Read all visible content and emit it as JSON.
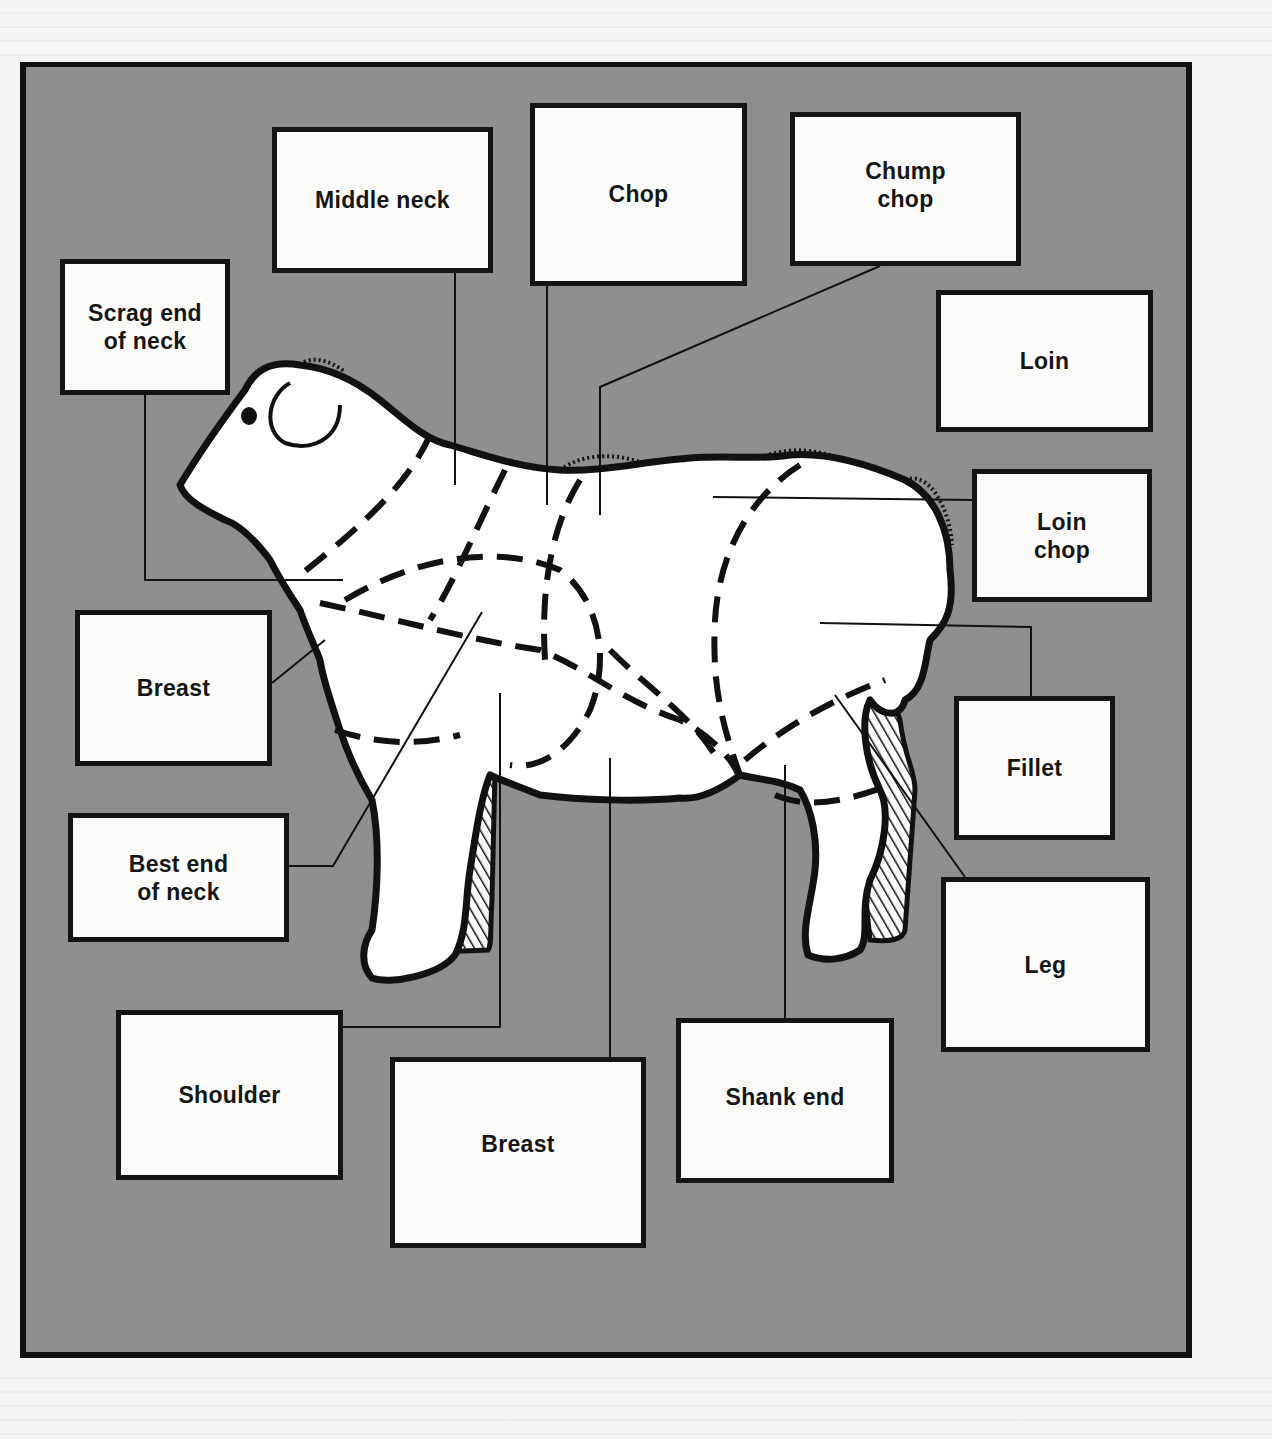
{
  "diagram": {
    "type": "labelled-illustration",
    "colors": {
      "panel_bg": "#8f8f8f",
      "box_bg": "#fbfbfa",
      "stroke": "#141414",
      "page_bg": "#f4f4f2"
    },
    "labels": [
      {
        "id": "scrag-end-of-neck",
        "text": "Scrag end\nof neck",
        "box": [
          60,
          259,
          230,
          395
        ]
      },
      {
        "id": "middle-neck",
        "text": "Middle neck",
        "box": [
          272,
          127,
          493,
          273
        ]
      },
      {
        "id": "chop",
        "text": "Chop",
        "box": [
          530,
          103,
          747,
          286
        ]
      },
      {
        "id": "chump-chop",
        "text": "Chump\nchop",
        "box": [
          790,
          112,
          1021,
          266
        ]
      },
      {
        "id": "loin",
        "text": "Loin",
        "box": [
          936,
          290,
          1153,
          432
        ]
      },
      {
        "id": "loin-chop",
        "text": "Loin\nchop",
        "box": [
          972,
          469,
          1152,
          602
        ]
      },
      {
        "id": "breast-left",
        "text": "Breast",
        "box": [
          75,
          610,
          272,
          766
        ]
      },
      {
        "id": "fillet",
        "text": "Fillet",
        "box": [
          954,
          696,
          1115,
          840
        ]
      },
      {
        "id": "best-end-of-neck",
        "text": "Best end\nof neck",
        "box": [
          68,
          813,
          289,
          942
        ]
      },
      {
        "id": "leg",
        "text": "Leg",
        "box": [
          941,
          877,
          1150,
          1052
        ]
      },
      {
        "id": "shoulder",
        "text": "Shoulder",
        "box": [
          116,
          1010,
          343,
          1180
        ]
      },
      {
        "id": "breast-bottom",
        "text": "Breast",
        "box": [
          390,
          1057,
          646,
          1248
        ]
      },
      {
        "id": "shank-end",
        "text": "Shank end",
        "box": [
          676,
          1018,
          894,
          1183
        ]
      }
    ]
  }
}
